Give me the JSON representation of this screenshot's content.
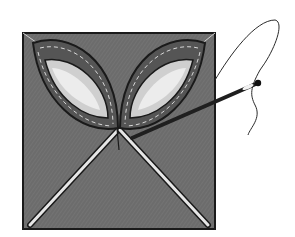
{
  "illustration": {
    "subject": "quilt block with two appliqued leaf petals and needle with thread",
    "colors": {
      "background": "#ffffff",
      "fabric": "#6e6e6e",
      "petal_outer": "#5a5a5a",
      "petal_inner": "#cfcfcf",
      "petal_highlight": "#ececec",
      "outline": "#1a1a1a",
      "stitch_line": "#e6e6e6",
      "needle": "#1f1f1f",
      "thread": "#2a2a2a"
    }
  }
}
